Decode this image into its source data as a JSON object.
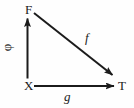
{
  "diagram": {
    "type": "commutative-triangle",
    "background_color": "#fefefe",
    "stroke_color": "#1b1b1b",
    "text_color": "#1b1b1b",
    "stroke_width": 2,
    "vertices": [
      {
        "id": "F",
        "label": "F",
        "x": 28,
        "y": 10
      },
      {
        "id": "X",
        "label": "X",
        "x": 28,
        "y": 86
      },
      {
        "id": "T",
        "label": "T",
        "x": 121,
        "y": 86
      }
    ],
    "edges": [
      {
        "id": "phi",
        "label": "φ",
        "from": "X",
        "to": "F",
        "direction": "up",
        "label_x": 10,
        "label_y": 48,
        "label_rotation": -90,
        "label_style": "upright"
      },
      {
        "id": "f",
        "label": "f",
        "from": "F",
        "to": "T",
        "direction": "down-right",
        "label_x": 89,
        "label_y": 38,
        "label_rotation": 0,
        "label_style": "italic"
      },
      {
        "id": "g",
        "label": "g",
        "from": "X",
        "to": "T",
        "direction": "right",
        "label_x": 68,
        "label_y": 96,
        "label_rotation": 0,
        "label_style": "italic"
      }
    ]
  }
}
